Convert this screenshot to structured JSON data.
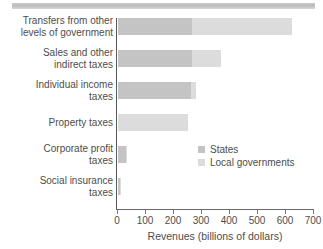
{
  "decor": {
    "top_rule": "horizontal-rule"
  },
  "chart_data": {
    "type": "bar",
    "orientation": "horizontal",
    "stacked": true,
    "title": "",
    "xlabel": "Revenues (billions of dollars)",
    "ylabel": "",
    "xlim": [
      0,
      700
    ],
    "xticks": [
      0,
      100,
      200,
      300,
      400,
      500,
      600,
      700
    ],
    "xtick_labels": [
      "0",
      "100",
      "200",
      "300",
      "400",
      "500",
      "600",
      "700"
    ],
    "grid": false,
    "legend_position": "inside-right",
    "categories": [
      "Transfers from other levels of government",
      "Sales and other indirect taxes",
      "Individual income taxes",
      "Property taxes",
      "Corporate profit taxes",
      "Social insurance taxes"
    ],
    "category_label_lines": [
      [
        "Transfers from other",
        "levels of government"
      ],
      [
        "Sales and other",
        "indirect taxes"
      ],
      [
        "Individual income",
        "taxes"
      ],
      [
        "Property taxes"
      ],
      [
        "Corporate profit",
        "taxes"
      ],
      [
        "Social insurance",
        "taxes"
      ]
    ],
    "series": [
      {
        "name": "States",
        "color": "#c4c4c4",
        "values": [
          265,
          265,
          262,
          0,
          27,
          8
        ]
      },
      {
        "name": "Local governments",
        "color": "#dcdcdc",
        "values": [
          357,
          103,
          16,
          250,
          6,
          2
        ]
      }
    ],
    "totals": [
      622,
      368,
      278,
      250,
      33,
      10
    ]
  },
  "legend": {
    "items": [
      {
        "label": "States",
        "swatch": "states"
      },
      {
        "label": "Local governments",
        "swatch": "local"
      }
    ]
  },
  "axis": {
    "x_title": "Revenues (billions of dollars)"
  }
}
